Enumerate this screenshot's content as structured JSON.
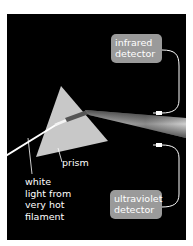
{
  "diagram": {
    "background_color": "#000000",
    "prism": {
      "label": "prism",
      "color": "#c8c8c8"
    },
    "light_source": {
      "label_lines": [
        "white",
        "light from",
        "very hot",
        "filament"
      ]
    },
    "detectors": [
      {
        "id": "infrared",
        "lines": [
          "infrared",
          "detector"
        ],
        "box_color": "#9a9a9a"
      },
      {
        "id": "ultraviolet",
        "lines": [
          "ultraviolet",
          "detector"
        ],
        "box_color": "#9a9a9a"
      }
    ]
  }
}
